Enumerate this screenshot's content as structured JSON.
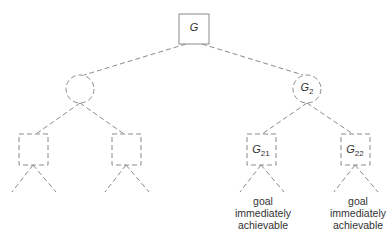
{
  "diagram": {
    "type": "and-or search tree",
    "root": {
      "label": "G",
      "shape": "square"
    },
    "level1": [
      {
        "label": "",
        "shape": "circle"
      },
      {
        "label": "G",
        "subscript": "2",
        "shape": "circle"
      }
    ],
    "level2": [
      {
        "label": "",
        "shape": "square"
      },
      {
        "label": "",
        "shape": "square"
      },
      {
        "label": "G",
        "subscript": "21",
        "shape": "square"
      },
      {
        "label": "G",
        "subscript": "22",
        "shape": "square"
      }
    ],
    "notes": [
      {
        "line1": "goal",
        "line2": "immediately",
        "line3": "achievable"
      },
      {
        "line1": "goal",
        "line2": "immediately",
        "line3": "achievable"
      }
    ],
    "line_color": "#8a8a8a"
  }
}
